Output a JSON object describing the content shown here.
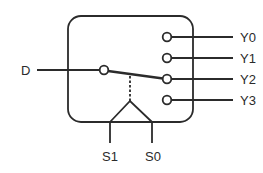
{
  "diagram": {
    "type": "1-to-4 demultiplexer",
    "input": {
      "label": "D"
    },
    "outputs": [
      {
        "label": "Y0"
      },
      {
        "label": "Y1"
      },
      {
        "label": "Y2"
      },
      {
        "label": "Y3"
      }
    ],
    "selects": [
      {
        "label": "S1"
      },
      {
        "label": "S0"
      }
    ],
    "active_output": "Y2",
    "colors": {
      "stroke": "#2b2b2b",
      "background": "#ffffff"
    }
  }
}
